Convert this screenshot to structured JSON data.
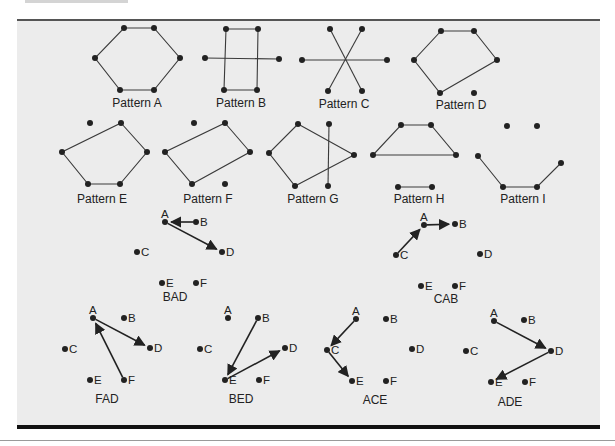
{
  "patterns": [
    {
      "id": "A",
      "caption": "Pattern A",
      "caption_pos": [
        137,
        107
      ],
      "dots": [
        [
          124,
          28
        ],
        [
          154,
          28
        ],
        [
          180,
          58
        ],
        [
          154,
          90
        ],
        [
          120,
          90
        ],
        [
          95,
          58
        ]
      ],
      "polygons": [
        [
          [
            124,
            28
          ],
          [
            154,
            28
          ],
          [
            180,
            58
          ],
          [
            154,
            90
          ],
          [
            120,
            90
          ],
          [
            95,
            58
          ]
        ]
      ],
      "lines": []
    },
    {
      "id": "B",
      "caption": "Pattern B",
      "caption_pos": [
        241,
        107
      ],
      "dots": [
        [
          226,
          29
        ],
        [
          258,
          29
        ],
        [
          257,
          90
        ],
        [
          224,
          90
        ],
        [
          205,
          58
        ],
        [
          279,
          59
        ]
      ],
      "polygons": [
        [
          [
            226,
            29
          ],
          [
            258,
            29
          ],
          [
            257,
            90
          ],
          [
            224,
            90
          ]
        ]
      ],
      "lines": [
        [
          [
            205,
            58
          ],
          [
            279,
            59
          ]
        ]
      ]
    },
    {
      "id": "C",
      "caption": "Pattern C",
      "caption_pos": [
        344,
        108
      ],
      "dots": [
        [
          330,
          29
        ],
        [
          362,
          29
        ],
        [
          302,
          60
        ],
        [
          387,
          60
        ],
        [
          328,
          91
        ],
        [
          362,
          91
        ]
      ],
      "polygons": [],
      "lines": [
        [
          [
            330,
            29
          ],
          [
            362,
            91
          ]
        ],
        [
          [
            362,
            29
          ],
          [
            328,
            91
          ]
        ],
        [
          [
            302,
            60
          ],
          [
            387,
            60
          ]
        ]
      ]
    },
    {
      "id": "D",
      "caption": "Pattern D",
      "caption_pos": [
        461,
        109
      ],
      "dots": [
        [
          441,
          31
        ],
        [
          474,
          31
        ],
        [
          497,
          60
        ],
        [
          440,
          93
        ],
        [
          414,
          60
        ],
        [
          474,
          93
        ]
      ],
      "polygons": [
        [
          [
            441,
            31
          ],
          [
            474,
            31
          ],
          [
            497,
            60
          ],
          [
            440,
            93
          ],
          [
            414,
            60
          ]
        ]
      ],
      "lines": []
    },
    {
      "id": "E",
      "caption": "Pattern E",
      "caption_pos": [
        102,
        203
      ],
      "dots": [
        [
          90,
          123
        ],
        [
          121,
          123
        ],
        [
          147,
          152
        ],
        [
          120,
          184
        ],
        [
          88,
          184
        ],
        [
          62,
          152
        ]
      ],
      "polygons": [
        [
          [
            121,
            123
          ],
          [
            147,
            152
          ],
          [
            120,
            184
          ],
          [
            88,
            184
          ],
          [
            62,
            152
          ]
        ]
      ],
      "lines": []
    },
    {
      "id": "F",
      "caption": "Pattern F",
      "caption_pos": [
        208,
        203
      ],
      "dots": [
        [
          194,
          123
        ],
        [
          225,
          123
        ],
        [
          250,
          152
        ],
        [
          192,
          184
        ],
        [
          165,
          152
        ],
        [
          225,
          184
        ]
      ],
      "polygons": [
        [
          [
            225,
            123
          ],
          [
            250,
            152
          ],
          [
            192,
            184
          ],
          [
            165,
            152
          ]
        ]
      ],
      "lines": []
    },
    {
      "id": "G",
      "caption": "Pattern G",
      "caption_pos": [
        313,
        203
      ],
      "dots": [
        [
          298,
          124
        ],
        [
          329,
          124
        ],
        [
          354,
          155
        ],
        [
          295,
          186
        ],
        [
          269,
          153
        ],
        [
          328,
          186
        ]
      ],
      "polygons": [
        [
          [
            298,
            124
          ],
          [
            354,
            155
          ],
          [
            295,
            186
          ],
          [
            269,
            153
          ]
        ]
      ],
      "lines": [
        [
          [
            329,
            124
          ],
          [
            328,
            186
          ]
        ]
      ]
    },
    {
      "id": "H",
      "caption": "Pattern H",
      "caption_pos": [
        419,
        203
      ],
      "dots": [
        [
          401,
          125
        ],
        [
          431,
          125
        ],
        [
          456,
          155
        ],
        [
          373,
          155
        ],
        [
          398,
          187
        ],
        [
          432,
          187
        ]
      ],
      "polygons": [
        [
          [
            401,
            125
          ],
          [
            431,
            125
          ],
          [
            456,
            155
          ],
          [
            373,
            155
          ]
        ]
      ],
      "lines": [
        [
          [
            398,
            187
          ],
          [
            432,
            187
          ]
        ]
      ]
    },
    {
      "id": "I",
      "caption": "Pattern I",
      "caption_pos": [
        523,
        203
      ],
      "dots": [
        [
          507,
          126
        ],
        [
          537,
          126
        ],
        [
          478,
          156
        ],
        [
          503,
          187
        ],
        [
          537,
          187
        ],
        [
          561,
          163
        ]
      ],
      "polygons": [],
      "polylines": [
        [
          [
            478,
            156
          ],
          [
            503,
            187
          ],
          [
            537,
            187
          ],
          [
            561,
            163
          ]
        ]
      ],
      "lines": []
    }
  ],
  "sequences": [
    {
      "name": "BAD",
      "caption_pos": [
        175,
        301
      ],
      "points": {
        "A": [
          165,
          222
        ],
        "B": [
          196,
          222
        ],
        "C": [
          137,
          252
        ],
        "D": [
          222,
          252
        ],
        "E": [
          162,
          283
        ],
        "F": [
          196,
          283
        ]
      },
      "arrows": [
        [
          "B",
          "A"
        ],
        [
          "A",
          "D"
        ]
      ]
    },
    {
      "name": "CAB",
      "caption_pos": [
        446,
        303
      ],
      "points": {
        "A": [
          424,
          225
        ],
        "B": [
          455,
          224
        ],
        "C": [
          396,
          255
        ],
        "D": [
          480,
          254
        ],
        "E": [
          421,
          286
        ],
        "F": [
          455,
          286
        ]
      },
      "arrows": [
        [
          "C",
          "A"
        ],
        [
          "A",
          "B"
        ]
      ]
    },
    {
      "name": "FAD",
      "caption_pos": [
        107,
        403
      ],
      "points": {
        "A": [
          93,
          318
        ],
        "B": [
          124,
          318
        ],
        "C": [
          65,
          349
        ],
        "D": [
          150,
          348
        ],
        "E": [
          90,
          380
        ],
        "F": [
          124,
          380
        ]
      },
      "arrows": [
        [
          "F",
          "A"
        ],
        [
          "A",
          "D"
        ]
      ]
    },
    {
      "name": "BED",
      "caption_pos": [
        241,
        403
      ],
      "points": {
        "A": [
          228,
          318
        ],
        "B": [
          258,
          318
        ],
        "C": [
          200,
          349
        ],
        "D": [
          285,
          348
        ],
        "E": [
          225,
          380
        ],
        "F": [
          259,
          380
        ]
      },
      "arrows": [
        [
          "B",
          "E"
        ],
        [
          "E",
          "D"
        ]
      ]
    },
    {
      "name": "ACE",
      "caption_pos": [
        375,
        404
      ],
      "points": {
        "A": [
          356,
          319
        ],
        "B": [
          386,
          319
        ],
        "C": [
          327,
          350
        ],
        "D": [
          412,
          349
        ],
        "E": [
          352,
          381
        ],
        "F": [
          386,
          381
        ]
      },
      "arrows": [
        [
          "A",
          "C"
        ],
        [
          "C",
          "E"
        ]
      ]
    },
    {
      "name": "ADE",
      "caption_pos": [
        510,
        406
      ],
      "points": {
        "A": [
          494,
          321
        ],
        "B": [
          524,
          320
        ],
        "C": [
          466,
          351
        ],
        "D": [
          551,
          351
        ],
        "E": [
          491,
          382
        ],
        "F": [
          525,
          382
        ]
      },
      "arrows": [
        [
          "A",
          "D"
        ],
        [
          "D",
          "E"
        ]
      ]
    }
  ],
  "colors": {
    "panel": "#ececec",
    "ink": "#222222",
    "line": "#3a3a3a"
  }
}
